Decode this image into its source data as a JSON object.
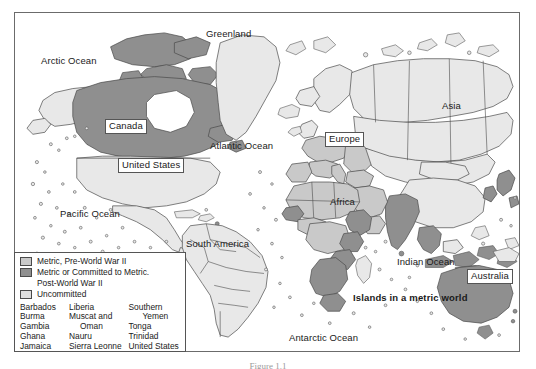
{
  "figure": {
    "caption": "Figure 1.1"
  },
  "map": {
    "title": "Metric world map",
    "frame": {
      "x": 14,
      "y": 12,
      "width": 506,
      "height": 340
    },
    "labels": [
      {
        "name": "label-arctic-ocean",
        "text": "Arctic Ocean",
        "x": 40,
        "y": 55,
        "style": "plain"
      },
      {
        "name": "label-greenland",
        "text": "Greenland",
        "x": 205,
        "y": 28,
        "style": "plain"
      },
      {
        "name": "label-canada",
        "text": "Canada",
        "x": 104,
        "y": 118,
        "style": "boxed"
      },
      {
        "name": "label-united-states",
        "text": "United States",
        "x": 117,
        "y": 157,
        "style": "boxed"
      },
      {
        "name": "label-atlantic-ocean",
        "text": "Atlantic Ocean",
        "x": 209,
        "y": 140,
        "style": "plain"
      },
      {
        "name": "label-pacific-ocean",
        "text": "Pacific Ocean",
        "x": 59,
        "y": 208,
        "style": "plain"
      },
      {
        "name": "label-south-america",
        "text": "South America",
        "x": 185,
        "y": 238,
        "style": "plain"
      },
      {
        "name": "label-europe",
        "text": "Europe",
        "x": 324,
        "y": 131,
        "style": "boxed"
      },
      {
        "name": "label-asia",
        "text": "Asia",
        "x": 441,
        "y": 100,
        "style": "plain"
      },
      {
        "name": "label-africa",
        "text": "Africa",
        "x": 329,
        "y": 196,
        "style": "plain"
      },
      {
        "name": "label-indian-ocean",
        "text": "Indian Ocean",
        "x": 396,
        "y": 256,
        "style": "plain"
      },
      {
        "name": "label-australia",
        "text": "Australia",
        "x": 466,
        "y": 268,
        "style": "boxed"
      },
      {
        "name": "label-islands-note",
        "text": "Islands in a metric world",
        "x": 352,
        "y": 292,
        "style": "bold"
      },
      {
        "name": "label-antarctic-ocean",
        "text": "Antarctic Ocean",
        "x": 288,
        "y": 332,
        "style": "plain"
      }
    ]
  },
  "legend": {
    "entries": [
      {
        "name": "legend-metric-pre-wwii",
        "swatch_color": "#c9c9c9",
        "line1": "Metric, Pre-World War II",
        "line2": ""
      },
      {
        "name": "legend-metric-post-wwii",
        "swatch_color": "#8f8f8f",
        "line1": "Metric or Committed to Metric.",
        "line2": "Post-World War II"
      },
      {
        "name": "legend-uncommitted",
        "swatch_color": "#dedede",
        "line1": "Uncommitted",
        "line2": ""
      }
    ],
    "country_columns": [
      {
        "name": "legend-country-column-1",
        "items": [
          {
            "text": "Barbados",
            "indent": false
          },
          {
            "text": "Burma",
            "indent": false
          },
          {
            "text": "Gambia",
            "indent": false
          },
          {
            "text": "Ghana",
            "indent": false
          },
          {
            "text": "Jamaica",
            "indent": false
          }
        ]
      },
      {
        "name": "legend-country-column-2",
        "items": [
          {
            "text": "Liberia",
            "indent": false
          },
          {
            "text": "Muscat and",
            "indent": false
          },
          {
            "text": "Oman",
            "indent": true
          },
          {
            "text": "Nauru",
            "indent": false
          },
          {
            "text": "Sierra Leonne",
            "indent": false
          }
        ]
      },
      {
        "name": "legend-country-column-3",
        "items": [
          {
            "text": "Southern",
            "indent": false
          },
          {
            "text": "Yemen",
            "indent": true
          },
          {
            "text": "Tonga",
            "indent": false
          },
          {
            "text": "Trinidad",
            "indent": false
          },
          {
            "text": "United States",
            "indent": false
          }
        ]
      }
    ]
  },
  "colors": {
    "metric_pre_wwii": "#c9c9c9",
    "metric_post_wwii": "#8f8f8f",
    "uncommitted": "#e6e6e6",
    "ocean": "#ffffff",
    "outline": "#4a4a4a",
    "frame": "#6b6b6b"
  }
}
